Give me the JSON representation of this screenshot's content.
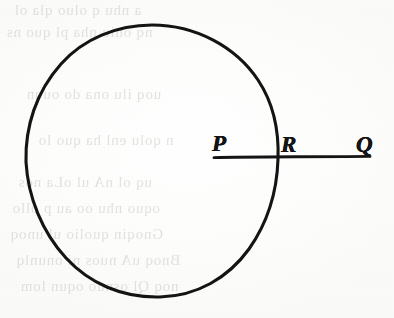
{
  "figure": {
    "kind": "geometry-diagram",
    "background_color": "#fdfdfc",
    "ink_color": "#141414"
  },
  "labels": {
    "p": "P",
    "r": "R",
    "q": "Q"
  },
  "points": [
    {
      "name": "P",
      "label": "P",
      "x": 214,
      "y": 157
    },
    {
      "name": "R",
      "label": "R",
      "x": 277,
      "y": 157
    },
    {
      "name": "Q",
      "label": "Q",
      "x": 370,
      "y": 157
    }
  ],
  "shapes": {
    "circle": {
      "center_x": 152,
      "center_y": 161,
      "radius_x": 126,
      "radius_y": 136,
      "stroke_width": 3,
      "stroke_color": "#141414",
      "fill": "none"
    },
    "secant_line": {
      "x1": 214,
      "y1": 157,
      "x2": 370,
      "y2": 157,
      "stroke_width": 3,
      "stroke_color": "#141414"
    }
  },
  "ghost_text": {
    "note": "illegible faint show-through from the reverse side of the scanned page",
    "color": "#b9b8b4",
    "lines": [
      "a nhu q oluo qla ol",
      "nq oniu nha pl quo ns",
      "uoq ilu ona do ouqn",
      "n qolu enl ha quo lo",
      "uq ol nA ul oLa nos",
      "oquo nhu oo au p ollo",
      "Gnoqin quolio ul unoq",
      "Bnoq uA nuos ni onunlq",
      "noq Ql osnuo oqun lom"
    ]
  }
}
